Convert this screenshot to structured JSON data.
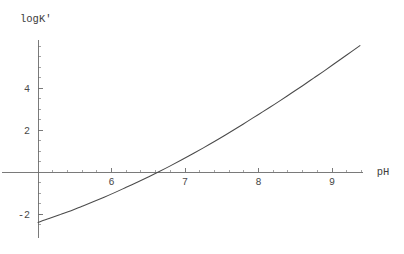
{
  "chart_data": {
    "type": "line",
    "title": "",
    "subtitle": "",
    "xlabel": "pH",
    "ylabel": "logK'",
    "xlim": [
      5.0,
      9.4
    ],
    "ylim": [
      -2.45,
      6.35
    ],
    "grid": false,
    "legend": null,
    "x_ticks": [
      {
        "value": 6,
        "label": "6"
      },
      {
        "value": 7,
        "label": "7"
      },
      {
        "value": 8,
        "label": "8"
      },
      {
        "value": 9,
        "label": "9"
      }
    ],
    "y_ticks": [
      {
        "value": -2,
        "label": "-2"
      },
      {
        "value": 2,
        "label": "2"
      },
      {
        "value": 4,
        "label": "4"
      }
    ],
    "x_minor_ticks": [
      5.2,
      5.4,
      5.6,
      5.8,
      6.2,
      6.4,
      6.6,
      6.8,
      7.2,
      7.4,
      7.6,
      7.8,
      8.2,
      8.4,
      8.6,
      8.8,
      9.2,
      9.4
    ],
    "y_minor_ticks": [
      -2.5,
      -2.0,
      -1.5,
      -1.0,
      -0.5,
      0.5,
      1.0,
      1.5,
      2.5,
      3.0,
      3.5,
      4.5,
      5.0,
      5.5,
      6.0
    ],
    "y_axis_at_x": 5.0,
    "x_axis_at_y": 0,
    "zero_crossing_x": 6.7,
    "series": [
      {
        "name": "logK'",
        "x": [
          5.0,
          5.15,
          5.3,
          5.45,
          5.6,
          5.75,
          5.9,
          6.05,
          6.2,
          6.35,
          6.5,
          6.65,
          6.8,
          6.95,
          7.1,
          7.25,
          7.4,
          7.55,
          7.7,
          7.85,
          8.0,
          8.15,
          8.3,
          8.45,
          8.6,
          8.75,
          8.9,
          9.05,
          9.2,
          9.38
        ],
        "y": [
          -2.4,
          -2.22,
          -2.03,
          -1.84,
          -1.63,
          -1.42,
          -1.2,
          -0.97,
          -0.73,
          -0.49,
          -0.24,
          0.02,
          0.29,
          0.57,
          0.86,
          1.15,
          1.45,
          1.76,
          2.08,
          2.41,
          2.74,
          3.07,
          3.41,
          3.76,
          4.11,
          4.47,
          4.83,
          5.2,
          5.57,
          6.02
        ]
      }
    ],
    "colors": {
      "curve": "#4a4a4a",
      "axis": "#6b6b6b",
      "text": "#4a4a4a",
      "background": "#ffffff"
    }
  }
}
